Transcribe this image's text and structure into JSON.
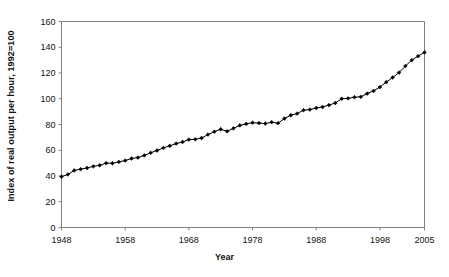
{
  "chart_data": {
    "type": "line",
    "title": "",
    "xlabel": "Year",
    "ylabel": "Index of real output per hour, 1992=100",
    "xlim": [
      1948,
      2005
    ],
    "ylim": [
      0,
      160
    ],
    "xticks": [
      1948,
      1958,
      1968,
      1978,
      1988,
      1998,
      2005
    ],
    "yticks": [
      0,
      20,
      40,
      60,
      80,
      100,
      120,
      140,
      160
    ],
    "grid": false,
    "legend": "none",
    "marker": "diamond",
    "line_color": "#000000",
    "marker_color": "#000000",
    "axis_color": "#808080",
    "x": [
      1948,
      1949,
      1950,
      1951,
      1952,
      1953,
      1954,
      1955,
      1956,
      1957,
      1958,
      1959,
      1960,
      1961,
      1962,
      1963,
      1964,
      1965,
      1966,
      1967,
      1968,
      1969,
      1970,
      1971,
      1972,
      1973,
      1974,
      1975,
      1976,
      1977,
      1978,
      1979,
      1980,
      1981,
      1982,
      1983,
      1984,
      1985,
      1986,
      1987,
      1988,
      1989,
      1990,
      1991,
      1992,
      1993,
      1994,
      1995,
      1996,
      1997,
      1998,
      1999,
      2000,
      2001,
      2002,
      2003,
      2004,
      2005
    ],
    "values": [
      39.5,
      41.2,
      44.3,
      45.3,
      46.2,
      47.5,
      48.3,
      50.0,
      49.9,
      50.9,
      52.0,
      53.6,
      54.3,
      56.0,
      58.0,
      59.8,
      61.8,
      63.4,
      65.2,
      66.4,
      68.3,
      68.5,
      69.5,
      72.2,
      74.4,
      76.3,
      74.7,
      77.0,
      79.3,
      80.5,
      81.4,
      81.1,
      80.7,
      81.8,
      81.0,
      84.6,
      87.2,
      88.5,
      91.1,
      91.6,
      92.8,
      93.6,
      95.1,
      96.7,
      100.0,
      100.3,
      101.2,
      101.5,
      104.0,
      106.1,
      109.1,
      112.9,
      116.5,
      120.3,
      125.4,
      130.0,
      133.1,
      136.0
    ]
  }
}
